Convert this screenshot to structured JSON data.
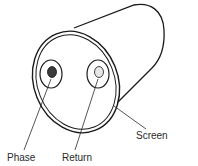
{
  "diagram": {
    "labels": {
      "phase": "Phase",
      "return": "Return",
      "screen": "Screen"
    },
    "colors": {
      "stroke": "#1a1a1a",
      "phase_core": "#3a3a3a",
      "return_core": "#e6e6e6",
      "background": "#ffffff"
    }
  }
}
